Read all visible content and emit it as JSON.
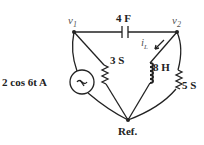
{
  "nodes": {
    "v1": {
      "label": "v",
      "sub": "1"
    },
    "v2": {
      "label": "v",
      "sub": "2"
    },
    "ref": {
      "label": "Ref."
    }
  },
  "components": {
    "capacitor": {
      "label": "4 F"
    },
    "resistor_3": {
      "label": "3 S"
    },
    "inductor": {
      "label": "8 H"
    },
    "resistor_5": {
      "label": "5 S"
    },
    "source": {
      "label": "2 cos 6t A"
    },
    "current": {
      "label": "i",
      "sub": "L"
    }
  }
}
